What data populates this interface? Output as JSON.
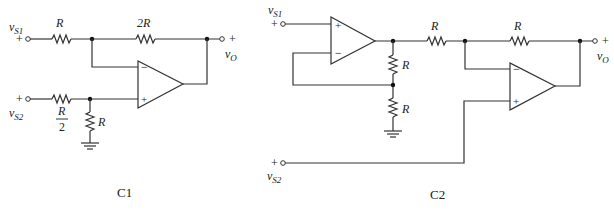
{
  "diagram": {
    "type": "circuit-schematic",
    "circuits": [
      {
        "id": "C1",
        "caption": "C1",
        "inputs": [
          {
            "label_main": "v",
            "label_sub": "S1",
            "polarity": "+"
          },
          {
            "label_main": "v",
            "label_sub": "S2",
            "polarity": "+"
          }
        ],
        "output": {
          "label_main": "v",
          "label_sub": "O",
          "polarity": "+"
        },
        "components": {
          "r_in1": "R",
          "r_feedback": "2R",
          "r_in2_num": "R",
          "r_in2_den": "2",
          "r_shunt": "R"
        },
        "opamp": {
          "minus": "−",
          "plus": "+"
        }
      },
      {
        "id": "C2",
        "caption": "C2",
        "inputs": [
          {
            "label_main": "v",
            "label_sub": "S1",
            "polarity": "+"
          },
          {
            "label_main": "v",
            "label_sub": "S2",
            "polarity": "+"
          }
        ],
        "output": {
          "label_main": "v",
          "label_sub": "O",
          "polarity": "+"
        },
        "components": {
          "r_div_top": "R",
          "r_div_bottom": "R",
          "r_series": "R",
          "r_feedback": "R"
        },
        "opamp1": {
          "minus": "−",
          "plus": "+"
        },
        "opamp2": {
          "minus": "−",
          "plus": "+"
        }
      }
    ]
  }
}
